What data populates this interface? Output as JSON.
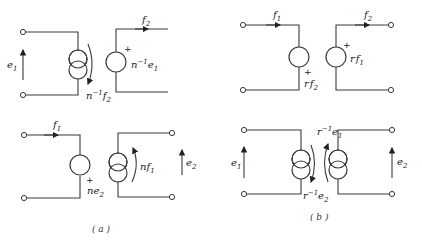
{
  "figure": {
    "panel_a": {
      "caption": "(a)",
      "top": {
        "port1_voltage": "e1",
        "dependent_current_source": "n⁻¹f2",
        "port2_current": "f2",
        "dependent_voltage_source": "n⁻¹e1",
        "polarity": "+"
      },
      "bottom": {
        "port1_current": "f1",
        "dependent_voltage_source": "ne2",
        "polarity": "+",
        "dependent_current_source": "nf1",
        "port2_voltage": "e2"
      }
    },
    "panel_b": {
      "caption": "(b)",
      "top": {
        "port1_current": "f1",
        "dependent_voltage_source_1": "rf2",
        "polarity_1": "+",
        "port2_current": "f2",
        "dependent_voltage_source_2": "rf1",
        "polarity_2": "+"
      },
      "bottom": {
        "port1_voltage": "e1",
        "dependent_current_source_1": "r⁻¹e2",
        "dependent_current_source_2": "r⁻¹e1",
        "port2_voltage": "e2"
      }
    }
  },
  "labels": {
    "e1": "e",
    "e1_sub": "1",
    "e2": "e",
    "e2_sub": "2",
    "f1": "f",
    "f1_sub": "1",
    "f2": "f",
    "f2_sub": "2",
    "n_inv": "n",
    "inv_exp": "−1",
    "n": "n",
    "r": "r",
    "r_inv": "r",
    "plus": "+",
    "cap_a": "( a )",
    "cap_b": "( b )"
  }
}
